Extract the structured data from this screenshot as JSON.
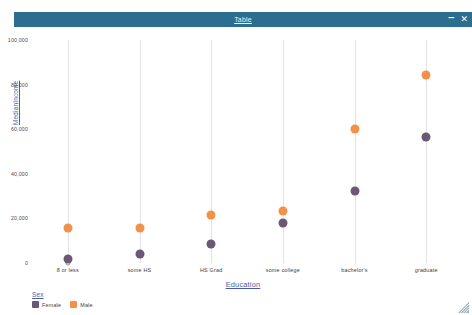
{
  "window": {
    "title": "Table",
    "minimize_label": "–",
    "close_label": "✕",
    "titlebar_color": "#2b6e8f"
  },
  "chart_data": {
    "type": "scatter",
    "title": "Table",
    "xlabel": "Education",
    "ylabel": "MedianIncome",
    "categories": [
      "8 or less",
      "some HS",
      "HS Grad",
      "some college",
      "bachelor's",
      "graduate"
    ],
    "ylim": [
      0,
      100000
    ],
    "yticks": [
      0,
      20000,
      40000,
      60000,
      80000,
      100000
    ],
    "ytick_labels": [
      "0",
      "20,000",
      "40,000",
      "60,000",
      "80,000",
      "100,000"
    ],
    "grid": "vertical",
    "legend": {
      "title": "Sex",
      "position": "bottom-left",
      "entries": [
        {
          "name": "Female",
          "color": "#6b5876"
        },
        {
          "name": "Male",
          "color": "#f39049"
        }
      ]
    },
    "series": [
      {
        "name": "Female",
        "color": "#6b5876",
        "values": [
          1800,
          4000,
          8500,
          18000,
          32500,
          56500
        ]
      },
      {
        "name": "Male",
        "color": "#f39049",
        "values": [
          15500,
          15500,
          21500,
          23500,
          60000,
          84500
        ]
      }
    ]
  }
}
